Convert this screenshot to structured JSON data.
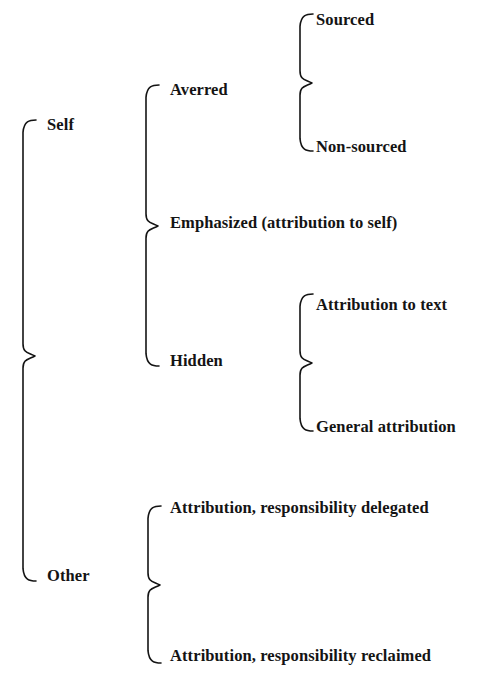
{
  "diagram": {
    "kind": "bracket-tree",
    "canvas": {
      "width": 493,
      "height": 685
    },
    "ink_color": "#141414",
    "background_color": "#ffffff",
    "nodes": {
      "self": "Self",
      "other": "Other",
      "averred": "Averred",
      "emphasized": "Emphasized (attribution to self)",
      "hidden": "Hidden",
      "sourced": "Sourced",
      "non_sourced": "Non-sourced",
      "attribution_to_text": "Attribution to text",
      "general_attribution": "General attribution",
      "resp_delegated": "Attribution, responsibility delegated",
      "resp_reclaimed": "Attribution, responsibility reclaimed"
    },
    "labels": [
      {
        "key": "self",
        "text": "Self",
        "level": 1,
        "x": 47,
        "y": 117
      },
      {
        "key": "averred",
        "text": "Averred",
        "level": 2,
        "x": 170,
        "y": 82
      },
      {
        "key": "sourced",
        "text": "Sourced",
        "level": 3,
        "x": 316,
        "y": 12
      },
      {
        "key": "non_sourced",
        "text": "Non-sourced",
        "level": 3,
        "x": 316,
        "y": 139
      },
      {
        "key": "emphasized",
        "text": "Emphasized (attribution to self)",
        "level": 2,
        "x": 170,
        "y": 215
      },
      {
        "key": "hidden",
        "text": "Hidden",
        "level": 2,
        "x": 170,
        "y": 353
      },
      {
        "key": "attribution_to_text",
        "text": "Attribution to text",
        "level": 3,
        "x": 316,
        "y": 297
      },
      {
        "key": "general_attribution",
        "text": "General attribution",
        "level": 3,
        "x": 316,
        "y": 419
      },
      {
        "key": "other",
        "text": "Other",
        "level": 1,
        "x": 47,
        "y": 568
      },
      {
        "key": "resp_delegated",
        "text": "Attribution, responsibility delegated",
        "level": 2,
        "x": 170,
        "y": 500
      },
      {
        "key": "resp_reclaimed",
        "text": "Attribution, responsibility reclaimed",
        "level": 2,
        "x": 170,
        "y": 648
      }
    ],
    "braces": [
      {
        "key": "brace-root",
        "parent": "root",
        "children": [
          "self",
          "other"
        ],
        "x": 23,
        "top": 120,
        "bottom": 581,
        "tip": 356,
        "arm": 13
      },
      {
        "key": "brace-self",
        "parent": "self",
        "children": [
          "averred",
          "emphasized",
          "hidden"
        ],
        "x": 146,
        "top": 85,
        "bottom": 366,
        "tip": 226,
        "arm": 13
      },
      {
        "key": "brace-averred",
        "parent": "averred",
        "children": [
          "sourced",
          "non_sourced"
        ],
        "x": 300,
        "top": 14,
        "bottom": 151,
        "tip": 83,
        "arm": 13
      },
      {
        "key": "brace-hidden",
        "parent": "hidden",
        "children": [
          "attribution_to_text",
          "general_attribution"
        ],
        "x": 300,
        "top": 294,
        "bottom": 431,
        "tip": 363,
        "arm": 13
      },
      {
        "key": "brace-other",
        "parent": "other",
        "children": [
          "resp_delegated",
          "resp_reclaimed"
        ],
        "x": 148,
        "top": 506,
        "bottom": 663,
        "tip": 585,
        "arm": 13
      }
    ],
    "stroke_width": 1.6
  }
}
